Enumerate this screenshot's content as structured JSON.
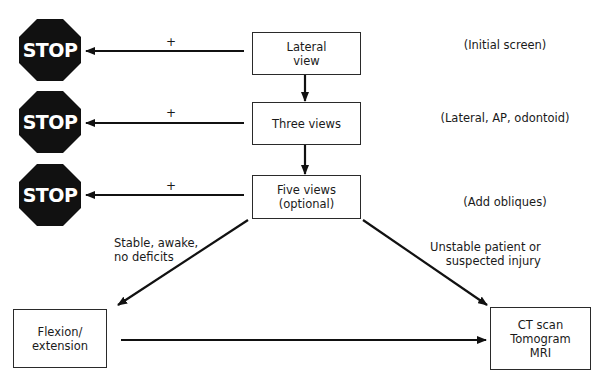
{
  "diagram": {
    "stop_signs": [
      {
        "id": "stop-1",
        "label": "STOP"
      },
      {
        "id": "stop-2",
        "label": "STOP"
      },
      {
        "id": "stop-3",
        "label": "STOP"
      }
    ],
    "steps": [
      {
        "id": "lateral-view",
        "label": "Lateral\nview",
        "note": "(Initial screen)",
        "positive_label": "+"
      },
      {
        "id": "three-views",
        "label": "Three views",
        "note": "(Lateral, AP, odontoid)",
        "positive_label": "+"
      },
      {
        "id": "five-views",
        "label": "Five views\n(optional)",
        "note": "(Add obliques)",
        "positive_label": "+"
      }
    ],
    "outcomes": {
      "flexion": {
        "label": "Flexion/\nextension"
      },
      "imaging": {
        "label": "CT scan\nTomogram\nMRI"
      }
    },
    "branch_labels": {
      "stable": "Stable, awake,\nno deficits",
      "unstable": "Unstable patient or\nsuspected injury"
    },
    "colors": {
      "stop_fill": "#111111",
      "stop_text": "#ffffff",
      "line": "#111111",
      "box_border": "#2a2a2a"
    }
  }
}
